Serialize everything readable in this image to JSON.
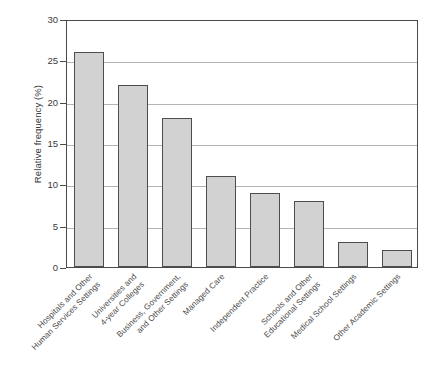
{
  "chart_data": {
    "type": "bar",
    "title": "",
    "xlabel": "",
    "ylabel": "Relative frequency (%)",
    "ylim": [
      0,
      30
    ],
    "yticks": [
      0,
      5,
      10,
      15,
      20,
      25,
      30
    ],
    "grid": true,
    "legend": "none",
    "categories": [
      "Hospitals and Other Human Services Settings",
      "Universities and 4-year Colleges",
      "Business, Government, and Other Settings",
      "Managed Care",
      "Independent Practice",
      "Schools and Other Educational Settings",
      "Medical School Settings",
      "Other Academic Settings"
    ],
    "category_lines": [
      [
        "Hospitals and Other",
        "Human Services Settings"
      ],
      [
        "Universities and",
        "4-year Colleges"
      ],
      [
        "Business, Government,",
        "and Other Settings"
      ],
      [
        "Managed Care",
        ""
      ],
      [
        "Independent Practice",
        ""
      ],
      [
        "Schools and Other",
        "Educational Settings"
      ],
      [
        "Medical School Settings",
        ""
      ],
      [
        "Other Academic Settings",
        ""
      ]
    ],
    "values": [
      26,
      22,
      18,
      11,
      9,
      8,
      3,
      2
    ],
    "colors": {
      "bar_fill": "#d2d2d2",
      "bar_edge": "#4e4e4e",
      "gridline": "#b4b4b4",
      "axis": "#4a4a4a",
      "text": "#3a3a3a",
      "background": "#ffffff"
    }
  }
}
